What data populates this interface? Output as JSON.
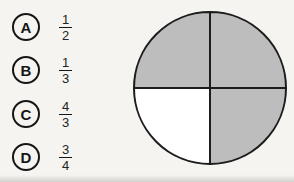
{
  "options": [
    {
      "label": "A",
      "numerator": "1",
      "denominator": "2"
    },
    {
      "label": "B",
      "numerator": "1",
      "denominator": "3"
    },
    {
      "label": "C",
      "numerator": "4",
      "denominator": "3"
    },
    {
      "label": "D",
      "numerator": "3",
      "denominator": "4"
    }
  ],
  "figure": {
    "type": "pie",
    "total_parts": 4,
    "shaded_parts": 3,
    "quadrants": [
      {
        "name": "top-left",
        "color": "#bdbdbd"
      },
      {
        "name": "top-right",
        "color": "#bdbdbd"
      },
      {
        "name": "bottom-right",
        "color": "#bdbdbd"
      },
      {
        "name": "bottom-left",
        "color": "#ffffff"
      }
    ],
    "outline_color": "#1c1c1c"
  }
}
